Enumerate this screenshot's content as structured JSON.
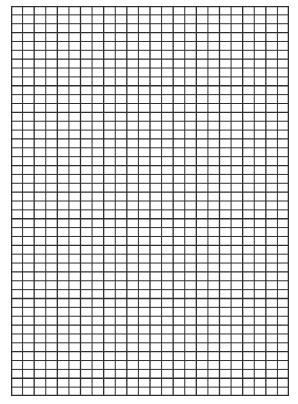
{
  "sheet": {
    "type": "grid-paper",
    "columns": 24,
    "rows": 44,
    "line_color": "#2e2e2e",
    "background_color": "#ffffff"
  }
}
